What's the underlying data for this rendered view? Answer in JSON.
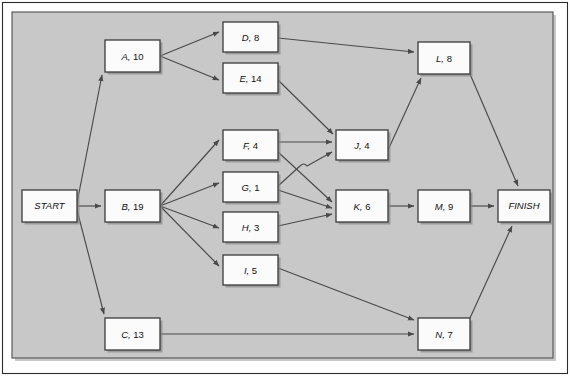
{
  "diagram": {
    "type": "activity-on-node-network",
    "colors": {
      "panel_background": "#c8c8c8",
      "node_fill": "#fbfbfb",
      "node_border": "#3a3a3a",
      "edge": "#4a4a4a",
      "page_background": "#ffffff",
      "frame": "#2b2b2b"
    },
    "nodes": [
      {
        "id": "START",
        "label": "START",
        "activity": "START",
        "duration": null,
        "x": 22,
        "y": 190,
        "w": 55,
        "h": 32,
        "terminal": true
      },
      {
        "id": "A",
        "label": "A, 10",
        "activity": "A",
        "duration": 10,
        "x": 105,
        "y": 40,
        "w": 55,
        "h": 32,
        "terminal": false
      },
      {
        "id": "B",
        "label": "B, 19",
        "activity": "B",
        "duration": 19,
        "x": 105,
        "y": 190,
        "w": 55,
        "h": 32,
        "terminal": false
      },
      {
        "id": "C",
        "label": "C, 13",
        "activity": "C",
        "duration": 13,
        "x": 105,
        "y": 318,
        "w": 55,
        "h": 32,
        "terminal": false
      },
      {
        "id": "D",
        "label": "D, 8",
        "activity": "D",
        "duration": 8,
        "x": 223,
        "y": 22,
        "w": 55,
        "h": 30,
        "terminal": false
      },
      {
        "id": "E",
        "label": "E, 14",
        "activity": "E",
        "duration": 14,
        "x": 223,
        "y": 63,
        "w": 55,
        "h": 30,
        "terminal": false
      },
      {
        "id": "F",
        "label": "F, 4",
        "activity": "F",
        "duration": 4,
        "x": 223,
        "y": 130,
        "w": 55,
        "h": 30,
        "terminal": false
      },
      {
        "id": "G",
        "label": "G, 1",
        "activity": "G",
        "duration": 1,
        "x": 223,
        "y": 172,
        "w": 55,
        "h": 30,
        "terminal": false
      },
      {
        "id": "H",
        "label": "H, 3",
        "activity": "H",
        "duration": 3,
        "x": 223,
        "y": 212,
        "w": 55,
        "h": 30,
        "terminal": false
      },
      {
        "id": "I",
        "label": "I, 5",
        "activity": "I",
        "duration": 5,
        "x": 223,
        "y": 255,
        "w": 55,
        "h": 30,
        "terminal": false
      },
      {
        "id": "J",
        "label": "J, 4",
        "activity": "J",
        "duration": 4,
        "x": 336,
        "y": 130,
        "w": 52,
        "h": 30,
        "terminal": false
      },
      {
        "id": "K",
        "label": "K, 6",
        "activity": "K",
        "duration": 6,
        "x": 336,
        "y": 190,
        "w": 52,
        "h": 32,
        "terminal": false
      },
      {
        "id": "L",
        "label": "L, 8",
        "activity": "L",
        "duration": 8,
        "x": 418,
        "y": 42,
        "w": 52,
        "h": 32,
        "terminal": false
      },
      {
        "id": "M",
        "label": "M, 9",
        "activity": "M",
        "duration": 9,
        "x": 418,
        "y": 190,
        "w": 52,
        "h": 32,
        "terminal": false
      },
      {
        "id": "N",
        "label": "N, 7",
        "activity": "N",
        "duration": 7,
        "x": 418,
        "y": 318,
        "w": 52,
        "h": 32,
        "terminal": false
      },
      {
        "id": "FINISH",
        "label": "FINISH",
        "activity": "FINISH",
        "duration": null,
        "x": 498,
        "y": 190,
        "w": 52,
        "h": 32,
        "terminal": true
      }
    ],
    "edges": [
      {
        "from": "START",
        "to": "A"
      },
      {
        "from": "START",
        "to": "B"
      },
      {
        "from": "START",
        "to": "C"
      },
      {
        "from": "A",
        "to": "D"
      },
      {
        "from": "A",
        "to": "E"
      },
      {
        "from": "B",
        "to": "F"
      },
      {
        "from": "B",
        "to": "G"
      },
      {
        "from": "B",
        "to": "H"
      },
      {
        "from": "B",
        "to": "I"
      },
      {
        "from": "D",
        "to": "L"
      },
      {
        "from": "E",
        "to": "J"
      },
      {
        "from": "F",
        "to": "J"
      },
      {
        "from": "F",
        "to": "K"
      },
      {
        "from": "G",
        "to": "J"
      },
      {
        "from": "G",
        "to": "K"
      },
      {
        "from": "H",
        "to": "K"
      },
      {
        "from": "I",
        "to": "N"
      },
      {
        "from": "C",
        "to": "N"
      },
      {
        "from": "J",
        "to": "L"
      },
      {
        "from": "K",
        "to": "M"
      },
      {
        "from": "L",
        "to": "FINISH"
      },
      {
        "from": "M",
        "to": "FINISH"
      },
      {
        "from": "N",
        "to": "FINISH"
      }
    ]
  }
}
